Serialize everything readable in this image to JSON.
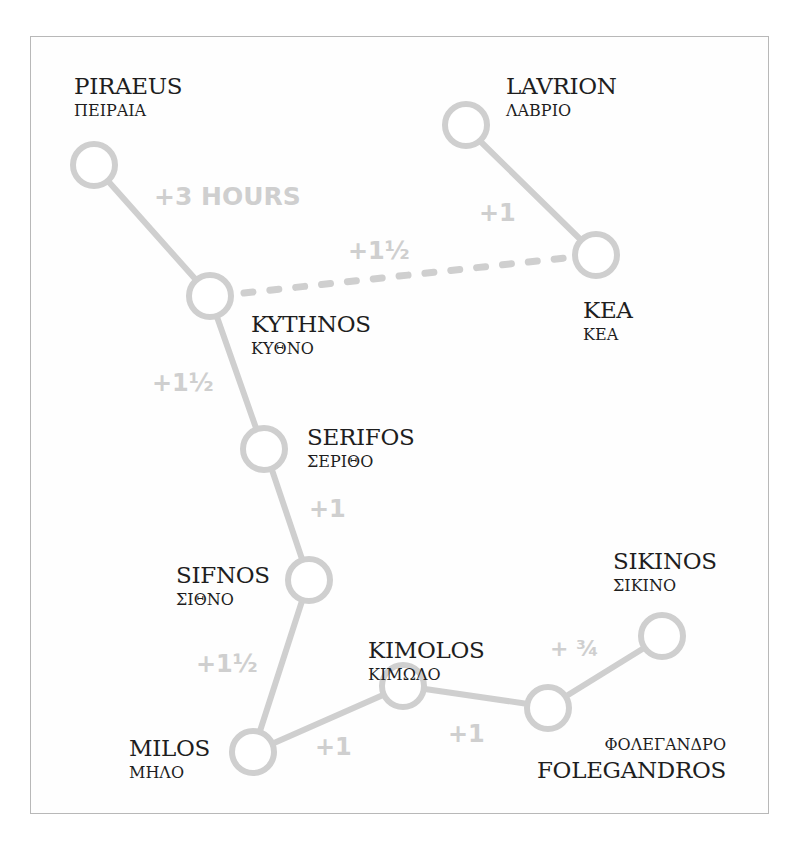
{
  "map": {
    "colors": {
      "route": "#cfcfcf",
      "label_text": "#1e1e1e",
      "duration_text": "#cfcfcf",
      "frame": "#b8b8b8"
    },
    "ports": [
      {
        "id": "piraeus",
        "name": "PIRAEUS",
        "greek": "ΠΕΙΡΑΙΑ"
      },
      {
        "id": "lavrion",
        "name": "LAVRION",
        "greek": "ΛΑΒΡΙΟ"
      },
      {
        "id": "kythnos",
        "name": "KYTHNOS",
        "greek": "ΚΥΘΝΟ"
      },
      {
        "id": "kea",
        "name": "KEA",
        "greek": "ΚΕΑ"
      },
      {
        "id": "serifos",
        "name": "SERIFOS",
        "greek": "ΣΕΡΙΘΟ"
      },
      {
        "id": "sifnos",
        "name": "SIFNOS",
        "greek": "ΣΙΘΝΟ"
      },
      {
        "id": "kimolos",
        "name": "KIMOLOS",
        "greek": "ΚΙΜΩΛΟ"
      },
      {
        "id": "sikinos",
        "name": "SIKINOS",
        "greek": "ΣΙΚΙΝΟ"
      },
      {
        "id": "milos",
        "name": "MILOS",
        "greek": "ΜΗΛΟ"
      },
      {
        "id": "folegandros",
        "name": "FOLEGANDROS",
        "greek": "ΦΟΛΕΓΑΝΔΡΟ"
      }
    ],
    "routes": [
      {
        "from": "PIRAEUS",
        "to": "KYTHNOS",
        "duration": "+3 HOURS",
        "style": "solid"
      },
      {
        "from": "LAVRION",
        "to": "KEA",
        "duration": "+1",
        "style": "solid"
      },
      {
        "from": "KYTHNOS",
        "to": "KEA",
        "duration": "+1½",
        "style": "dashed"
      },
      {
        "from": "KYTHNOS",
        "to": "SERIFOS",
        "duration": "+1½",
        "style": "solid"
      },
      {
        "from": "SERIFOS",
        "to": "SIFNOS",
        "duration": "+1",
        "style": "solid"
      },
      {
        "from": "SIFNOS",
        "to": "MILOS",
        "duration": "+1½",
        "style": "solid"
      },
      {
        "from": "MILOS",
        "to": "KIMOLOS",
        "duration": "+1",
        "style": "solid"
      },
      {
        "from": "KIMOLOS",
        "to": "FOLEGANDROS",
        "duration": "+1",
        "style": "solid"
      },
      {
        "from": "FOLEGANDROS",
        "to": "SIKINOS",
        "duration": "+ ¾",
        "style": "solid"
      }
    ]
  }
}
